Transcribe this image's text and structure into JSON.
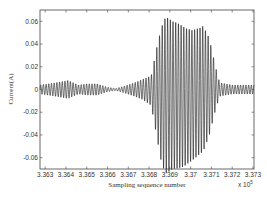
{
  "chart_data": {
    "type": "line",
    "title": "",
    "xlabel": "Sampling sequence number",
    "ylabel": "Current(A)",
    "x_multiplier_label": "x 10",
    "x_multiplier_exponent": "5",
    "xlim": [
      3.36275,
      3.37305
    ],
    "ylim": [
      -0.07,
      0.07
    ],
    "grid": false,
    "x_ticks": [
      3.363,
      3.364,
      3.365,
      3.366,
      3.367,
      3.368,
      3.369,
      3.37,
      3.371,
      3.372,
      3.373
    ],
    "x_tick_labels": [
      "3.363",
      "3.364",
      "3.365",
      "3.366",
      "3.367",
      "3.368",
      "3.369",
      "3.37",
      "3.371",
      "3.372",
      "3.373"
    ],
    "y_ticks": [
      0.06,
      0.04,
      0.02,
      0,
      -0.02,
      -0.04,
      -0.06
    ],
    "y_tick_labels": [
      "0.06",
      "0.04",
      "0.02",
      "0",
      "-0.02",
      "-0.04",
      "-0.06"
    ],
    "series": [
      {
        "name": "current",
        "color": "#000000",
        "oscillation_period_x": 0.00013,
        "upper_envelope": [
          [
            3.36275,
            0.004
          ],
          [
            3.3635,
            0.006
          ],
          [
            3.3641,
            0.008
          ],
          [
            3.3646,
            0.004
          ],
          [
            3.365,
            0.005
          ],
          [
            3.3655,
            0.005
          ],
          [
            3.366,
            0.002
          ],
          [
            3.3664,
            0.001
          ],
          [
            3.3668,
            0.003
          ],
          [
            3.3673,
            0.006
          ],
          [
            3.3677,
            0.009
          ],
          [
            3.3681,
            0.012
          ],
          [
            3.3684,
            0.04
          ],
          [
            3.3686,
            0.055
          ],
          [
            3.3688,
            0.064
          ],
          [
            3.3692,
            0.06
          ],
          [
            3.3697,
            0.055
          ],
          [
            3.3701,
            0.052
          ],
          [
            3.3706,
            0.056
          ],
          [
            3.3709,
            0.045
          ],
          [
            3.3712,
            0.02
          ],
          [
            3.3714,
            0.006
          ],
          [
            3.372,
            0.004
          ],
          [
            3.37305,
            0.004
          ]
        ],
        "lower_envelope": [
          [
            3.36275,
            -0.004
          ],
          [
            3.3635,
            -0.006
          ],
          [
            3.3641,
            -0.008
          ],
          [
            3.3646,
            -0.004
          ],
          [
            3.365,
            -0.005
          ],
          [
            3.3655,
            -0.005
          ],
          [
            3.366,
            -0.002
          ],
          [
            3.3664,
            -0.001
          ],
          [
            3.3668,
            -0.003
          ],
          [
            3.3673,
            -0.006
          ],
          [
            3.3677,
            -0.009
          ],
          [
            3.3681,
            -0.014
          ],
          [
            3.3684,
            -0.045
          ],
          [
            3.3686,
            -0.065
          ],
          [
            3.3688,
            -0.074
          ],
          [
            3.3692,
            -0.07
          ],
          [
            3.3697,
            -0.068
          ],
          [
            3.3701,
            -0.062
          ],
          [
            3.3706,
            -0.055
          ],
          [
            3.3709,
            -0.04
          ],
          [
            3.3712,
            -0.018
          ],
          [
            3.3714,
            -0.006
          ],
          [
            3.372,
            -0.004
          ],
          [
            3.37305,
            -0.004
          ]
        ]
      }
    ]
  }
}
